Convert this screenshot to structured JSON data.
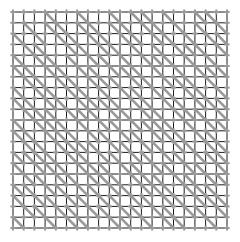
{
  "figure": {
    "name": "lattice-grid-with-diagonals",
    "type": "diagram",
    "canvas": {
      "width": 240,
      "height": 242,
      "background": "#ffffff"
    },
    "plot_area": {
      "x": 13,
      "y": 12,
      "width": 214,
      "height": 216
    },
    "grid": {
      "columns": 20,
      "rows": 20,
      "cell_width": 10.7,
      "cell_height": 10.8,
      "line_color": "#1a1a1a",
      "line_width": 1.0
    },
    "nodes": {
      "shape": "plus",
      "color": "#9a9a9a",
      "size": 5.2,
      "thickness": 2.0,
      "count_x": 21,
      "count_y": 21,
      "total": 441
    },
    "diagonals": {
      "direction": "top-left-to-bottom-right",
      "color": "#9a9a9a",
      "width": 2.6,
      "description": "gray diagonal edges drawn across a subset of grid cells"
    },
    "diagonal_cells": [
      [
        0,
        0,
        0,
        1,
        0,
        0,
        1,
        0,
        0,
        1,
        0,
        1,
        1,
        0,
        1,
        0,
        0,
        1,
        1,
        0
      ],
      [
        0,
        1,
        0,
        1,
        1,
        0,
        1,
        1,
        0,
        1,
        1,
        0,
        1,
        1,
        0,
        1,
        0,
        1,
        0,
        1
      ],
      [
        1,
        0,
        1,
        0,
        1,
        1,
        0,
        1,
        1,
        0,
        1,
        1,
        0,
        1,
        1,
        0,
        1,
        0,
        1,
        1
      ],
      [
        0,
        1,
        1,
        0,
        0,
        1,
        1,
        0,
        1,
        1,
        0,
        1,
        0,
        1,
        0,
        1,
        1,
        1,
        0,
        1
      ],
      [
        1,
        0,
        1,
        1,
        0,
        1,
        0,
        1,
        1,
        0,
        1,
        0,
        1,
        1,
        1,
        0,
        1,
        0,
        1,
        0
      ],
      [
        1,
        1,
        0,
        1,
        1,
        0,
        1,
        1,
        0,
        1,
        1,
        1,
        0,
        1,
        0,
        1,
        0,
        1,
        1,
        1
      ],
      [
        0,
        1,
        1,
        0,
        1,
        1,
        0,
        1,
        1,
        1,
        0,
        1,
        1,
        0,
        1,
        1,
        1,
        0,
        1,
        0
      ],
      [
        1,
        0,
        1,
        1,
        0,
        1,
        1,
        0,
        1,
        0,
        1,
        1,
        0,
        1,
        1,
        0,
        1,
        1,
        0,
        1
      ],
      [
        1,
        1,
        0,
        1,
        1,
        0,
        1,
        1,
        1,
        1,
        0,
        1,
        1,
        0,
        1,
        1,
        0,
        1,
        1,
        1
      ],
      [
        0,
        1,
        1,
        1,
        0,
        1,
        1,
        1,
        0,
        1,
        1,
        0,
        1,
        1,
        0,
        1,
        1,
        1,
        0,
        1
      ],
      [
        1,
        0,
        1,
        1,
        1,
        0,
        1,
        0,
        1,
        1,
        0,
        1,
        1,
        1,
        1,
        0,
        1,
        0,
        1,
        1
      ],
      [
        1,
        1,
        0,
        1,
        1,
        1,
        0,
        1,
        1,
        0,
        1,
        1,
        0,
        1,
        1,
        1,
        0,
        1,
        1,
        0
      ],
      [
        0,
        1,
        1,
        0,
        1,
        1,
        1,
        1,
        0,
        1,
        1,
        0,
        1,
        1,
        0,
        1,
        1,
        0,
        1,
        1
      ],
      [
        1,
        1,
        1,
        1,
        0,
        1,
        1,
        0,
        1,
        1,
        0,
        1,
        1,
        0,
        1,
        1,
        0,
        1,
        1,
        1
      ],
      [
        1,
        0,
        1,
        1,
        1,
        0,
        1,
        1,
        1,
        0,
        1,
        1,
        0,
        1,
        1,
        0,
        1,
        1,
        0,
        1
      ],
      [
        0,
        1,
        1,
        0,
        1,
        1,
        0,
        1,
        1,
        1,
        0,
        1,
        1,
        1,
        0,
        1,
        1,
        0,
        1,
        1
      ],
      [
        1,
        1,
        0,
        1,
        1,
        0,
        1,
        1,
        0,
        1,
        1,
        0,
        1,
        1,
        1,
        0,
        1,
        1,
        1,
        0
      ],
      [
        1,
        0,
        1,
        1,
        0,
        1,
        1,
        0,
        1,
        1,
        0,
        1,
        1,
        0,
        1,
        1,
        0,
        1,
        1,
        1
      ],
      [
        0,
        1,
        1,
        0,
        1,
        1,
        0,
        1,
        1,
        0,
        1,
        1,
        0,
        1,
        1,
        0,
        1,
        1,
        0,
        1
      ],
      [
        1,
        0,
        0,
        1,
        0,
        1,
        1,
        0,
        0,
        1,
        1,
        0,
        1,
        0,
        1,
        1,
        0,
        0,
        1,
        0
      ]
    ]
  }
}
